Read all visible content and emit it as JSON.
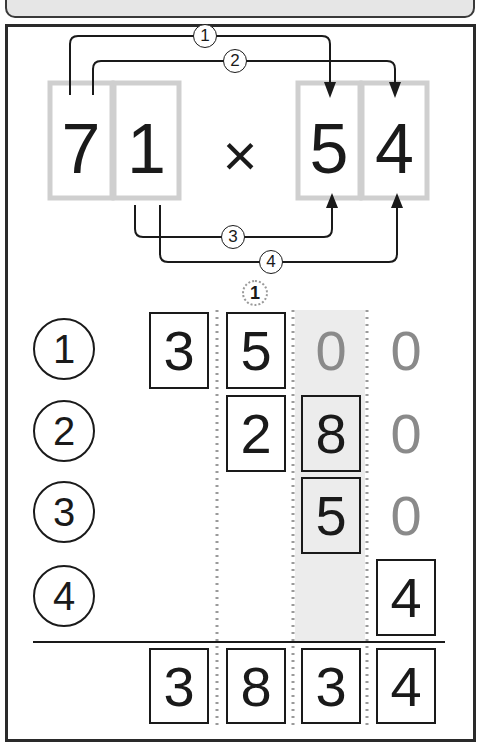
{
  "header": {
    "title": ""
  },
  "problem": {
    "multiplicand": [
      "7",
      "1"
    ],
    "operator": "×",
    "multiplier": [
      "5",
      "4"
    ],
    "steps": [
      {
        "label": "1",
        "from": "7",
        "to": "5"
      },
      {
        "label": "2",
        "from": "7",
        "to": "4"
      },
      {
        "label": "3",
        "from": "1",
        "to": "5"
      },
      {
        "label": "4",
        "from": "1",
        "to": "4"
      }
    ]
  },
  "carry": {
    "value": "1",
    "column": 2
  },
  "rows": [
    {
      "label": "1",
      "cells": [
        "3",
        "5",
        "0",
        "0"
      ],
      "boxed": [
        true,
        true,
        false,
        false
      ]
    },
    {
      "label": "2",
      "cells": [
        "",
        "2",
        "8",
        "0"
      ],
      "boxed": [
        false,
        true,
        true,
        false
      ]
    },
    {
      "label": "3",
      "cells": [
        "",
        "",
        "5",
        "0"
      ],
      "boxed": [
        false,
        false,
        true,
        false
      ]
    },
    {
      "label": "4",
      "cells": [
        "",
        "",
        "",
        "4"
      ],
      "boxed": [
        false,
        false,
        false,
        true
      ]
    }
  ],
  "result": [
    "3",
    "8",
    "3",
    "4"
  ],
  "colors": {
    "ink": "#1a1a1a",
    "placeholder_zero": "#8a8a8a",
    "shade": "#ececec",
    "guide_box": "#cfcfcf",
    "dotted_line": "#9a9a9a"
  }
}
